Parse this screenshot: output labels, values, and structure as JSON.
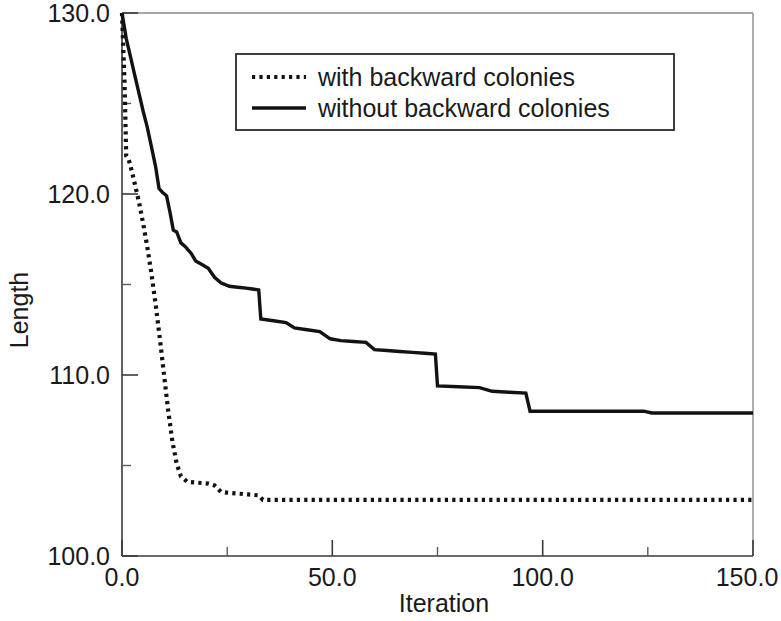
{
  "chart_data": {
    "type": "line",
    "title": "",
    "subtitle": "",
    "xlabel": "Iteration",
    "ylabel": "Length",
    "xlim": [
      0.0,
      150.0
    ],
    "ylim": [
      100.0,
      130.0
    ],
    "grid": false,
    "legend_position": "top-center",
    "x_ticks": [
      "0.0",
      "50.0",
      "100.0",
      "150.0"
    ],
    "x_tick_values": [
      0,
      50,
      100,
      150
    ],
    "x_minor_tick_values": [
      25,
      75,
      125
    ],
    "y_ticks": [
      "100.0",
      "110.0",
      "120.0",
      "130.0"
    ],
    "y_tick_values": [
      100,
      110,
      120,
      130
    ],
    "y_minor_tick_values": [
      105,
      115,
      125
    ],
    "series": [
      {
        "name": "with backward colonies",
        "style": "dotted",
        "color": "#121212",
        "points": [
          [
            0.0,
            130.0
          ],
          [
            0.6,
            126.2
          ],
          [
            1.0,
            122.1
          ],
          [
            1.6,
            121.9
          ],
          [
            2.4,
            121.2
          ],
          [
            3.2,
            120.4
          ],
          [
            4.0,
            119.6
          ],
          [
            5.0,
            118.4
          ],
          [
            6.0,
            117.1
          ],
          [
            7.0,
            115.6
          ],
          [
            8.0,
            113.9
          ],
          [
            9.0,
            112.0
          ],
          [
            10.0,
            110.0
          ],
          [
            11.0,
            108.0
          ],
          [
            12.0,
            106.3
          ],
          [
            13.0,
            105.1
          ],
          [
            14.0,
            104.4
          ],
          [
            15.5,
            104.1
          ],
          [
            18.0,
            104.05
          ],
          [
            20.5,
            104.0
          ],
          [
            22.0,
            103.9
          ],
          [
            23.5,
            103.55
          ],
          [
            25.0,
            103.5
          ],
          [
            27.5,
            103.45
          ],
          [
            30.0,
            103.4
          ],
          [
            32.5,
            103.35
          ],
          [
            33.5,
            103.1
          ],
          [
            40.0,
            103.1
          ],
          [
            60.0,
            103.1
          ],
          [
            80.0,
            103.1
          ],
          [
            100.0,
            103.1
          ],
          [
            120.0,
            103.1
          ],
          [
            140.0,
            103.1
          ],
          [
            150.0,
            103.1
          ]
        ]
      },
      {
        "name": "without backward colonies",
        "style": "solid",
        "color": "#121212",
        "points": [
          [
            0.0,
            130.0
          ],
          [
            1.0,
            128.6
          ],
          [
            2.0,
            127.6
          ],
          [
            3.0,
            126.6
          ],
          [
            4.0,
            125.6
          ],
          [
            5.0,
            124.6
          ],
          [
            6.0,
            123.7
          ],
          [
            7.0,
            122.6
          ],
          [
            8.0,
            121.5
          ],
          [
            8.8,
            120.3
          ],
          [
            9.6,
            120.1
          ],
          [
            10.6,
            119.9
          ],
          [
            11.4,
            119.0
          ],
          [
            12.2,
            118.0
          ],
          [
            13.0,
            117.9
          ],
          [
            14.0,
            117.3
          ],
          [
            15.0,
            117.1
          ],
          [
            16.5,
            116.7
          ],
          [
            17.5,
            116.3
          ],
          [
            19.0,
            116.1
          ],
          [
            20.5,
            115.9
          ],
          [
            22.0,
            115.4
          ],
          [
            23.5,
            115.1
          ],
          [
            25.5,
            114.9
          ],
          [
            27.5,
            114.85
          ],
          [
            29.5,
            114.8
          ],
          [
            31.0,
            114.75
          ],
          [
            32.5,
            114.7
          ],
          [
            33.0,
            113.1
          ],
          [
            36.0,
            113.0
          ],
          [
            39.0,
            112.9
          ],
          [
            41.0,
            112.6
          ],
          [
            44.0,
            112.5
          ],
          [
            47.0,
            112.4
          ],
          [
            49.5,
            112.0
          ],
          [
            52.0,
            111.9
          ],
          [
            55.0,
            111.85
          ],
          [
            58.0,
            111.8
          ],
          [
            60.0,
            111.4
          ],
          [
            63.0,
            111.35
          ],
          [
            66.0,
            111.3
          ],
          [
            69.0,
            111.25
          ],
          [
            72.0,
            111.2
          ],
          [
            74.5,
            111.15
          ],
          [
            75.0,
            109.4
          ],
          [
            80.0,
            109.35
          ],
          [
            85.0,
            109.3
          ],
          [
            88.0,
            109.1
          ],
          [
            92.0,
            109.05
          ],
          [
            96.0,
            109.0
          ],
          [
            97.0,
            108.0
          ],
          [
            105.0,
            108.0
          ],
          [
            115.0,
            108.0
          ],
          [
            124.0,
            108.0
          ],
          [
            126.0,
            107.9
          ],
          [
            135.0,
            107.9
          ],
          [
            145.0,
            107.9
          ],
          [
            150.0,
            107.9
          ]
        ]
      }
    ],
    "annotations": []
  },
  "legend": {
    "entries": [
      {
        "label": "with backward colonies",
        "style": "dotted"
      },
      {
        "label": "without backward colonies",
        "style": "solid"
      }
    ]
  },
  "axes": {
    "y_title": "Length",
    "x_title": "Iteration",
    "y_tick_labels": [
      "130.0",
      "120.0",
      "110.0",
      "100.0"
    ],
    "x_tick_labels": [
      "0.0",
      "50.0",
      "100.0",
      "150.0"
    ]
  },
  "colors": {
    "series": "#121212",
    "axis": "#3a3a3a",
    "text": "#1a1a1a",
    "background": "#ffffff"
  }
}
